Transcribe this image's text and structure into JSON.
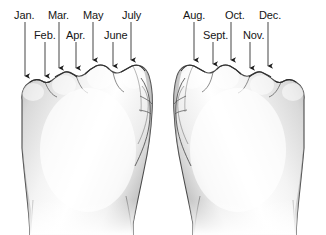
{
  "figure": {
    "type": "knuckle-mnemonic",
    "background_color": "#ffffff",
    "ink_color": "#151515",
    "skin_shade_light": "#ffffff",
    "skin_shade_mid": "#dcdcdc",
    "skin_shade_dark": "#9a9a9a",
    "outline_color": "#3a3a3a"
  },
  "hands": [
    {
      "name": "left-fist",
      "side": "left"
    },
    {
      "name": "right-fist",
      "side": "right"
    }
  ],
  "labels": {
    "row1": [
      {
        "text": "Jan.",
        "x": 14,
        "row": 1
      },
      {
        "text": "Mar.",
        "x": 48,
        "row": 1
      },
      {
        "text": "May",
        "x": 83,
        "row": 1
      },
      {
        "text": "July",
        "x": 122,
        "row": 1
      },
      {
        "text": "Aug.",
        "x": 183,
        "row": 1
      },
      {
        "text": "Oct.",
        "x": 225,
        "row": 1
      },
      {
        "text": "Dec.",
        "x": 259,
        "row": 1
      }
    ],
    "row2": [
      {
        "text": "Feb.",
        "x": 34,
        "row": 2
      },
      {
        "text": "Apr.",
        "x": 66,
        "row": 2
      },
      {
        "text": "June",
        "x": 104,
        "row": 2
      },
      {
        "text": "Sept.",
        "x": 203,
        "row": 2
      },
      {
        "text": "Nov.",
        "x": 243,
        "row": 2
      }
    ]
  },
  "pointers": [
    {
      "month": "Jan.",
      "x": 25,
      "y_start": 22,
      "y_end": 82,
      "knuckle": true
    },
    {
      "month": "Feb.",
      "x": 45,
      "y_start": 42,
      "y_end": 82,
      "knuckle": false
    },
    {
      "month": "Mar.",
      "x": 59,
      "y_start": 22,
      "y_end": 74,
      "knuckle": true
    },
    {
      "month": "Apr.",
      "x": 76,
      "y_start": 42,
      "y_end": 74,
      "knuckle": false
    },
    {
      "month": "May",
      "x": 93,
      "y_start": 22,
      "y_end": 66,
      "knuckle": true
    },
    {
      "month": "June",
      "x": 113,
      "y_start": 42,
      "y_end": 72,
      "knuckle": false
    },
    {
      "month": "July",
      "x": 131,
      "y_start": 22,
      "y_end": 66,
      "knuckle": true
    },
    {
      "month": "Aug.",
      "x": 194,
      "y_start": 22,
      "y_end": 66,
      "knuckle": true
    },
    {
      "month": "Sept.",
      "x": 213,
      "y_start": 42,
      "y_end": 70,
      "knuckle": false
    },
    {
      "month": "Oct.",
      "x": 231,
      "y_start": 22,
      "y_end": 66,
      "knuckle": true
    },
    {
      "month": "Nov.",
      "x": 250,
      "y_start": 42,
      "y_end": 74,
      "knuckle": false
    },
    {
      "month": "Dec.",
      "x": 268,
      "y_start": 22,
      "y_end": 72,
      "knuckle": true
    }
  ],
  "chart_data": {
    "type": "table",
    "categories": [
      "Jan.",
      "Feb.",
      "Mar.",
      "Apr.",
      "May",
      "June",
      "July",
      "Aug.",
      "Sept.",
      "Oct.",
      "Nov.",
      "Dec."
    ],
    "values": [
      31,
      28,
      31,
      30,
      31,
      30,
      31,
      31,
      30,
      31,
      30,
      31
    ],
    "positions": [
      "knuckle",
      "valley",
      "knuckle",
      "valley",
      "knuckle",
      "valley",
      "knuckle",
      "knuckle",
      "valley",
      "knuckle",
      "valley",
      "knuckle"
    ],
    "hand": [
      "left",
      "left",
      "left",
      "left",
      "left",
      "left",
      "left",
      "right",
      "right",
      "right",
      "right",
      "right"
    ],
    "xlabel": "Month",
    "ylabel": "Days"
  }
}
